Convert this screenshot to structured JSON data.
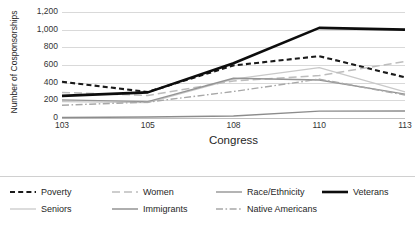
{
  "chart_data": {
    "type": "line",
    "title": "",
    "xlabel": "Congress",
    "ylabel": "Number of Cosponsorships",
    "categories": [
      "103",
      "105",
      "108",
      "110",
      "113"
    ],
    "x_tick_labels": [
      "103",
      "105",
      "108",
      "110",
      "113"
    ],
    "y_tick_labels": [
      "0",
      "200",
      "400",
      "600",
      "800",
      "1,000",
      "1,200"
    ],
    "y_tick_values": [
      0,
      200,
      400,
      600,
      800,
      1000,
      1200
    ],
    "ylim": [
      0,
      1200
    ],
    "grid": "horizontal",
    "legend_position": "bottom",
    "series": [
      {
        "name": "Poverty",
        "values": [
          410,
          295,
          595,
          700,
          460
        ],
        "color": "#1a1a1a",
        "style": "dashed",
        "width": 2.1,
        "dash": "5,3.2"
      },
      {
        "name": "Seniors",
        "values": [
          185,
          175,
          440,
          570,
          295
        ],
        "color": "#c9c9c9",
        "style": "solid",
        "width": 1.3,
        "dash": "none"
      },
      {
        "name": "Women",
        "values": [
          290,
          255,
          420,
          480,
          640
        ],
        "color": "#bdbdbd",
        "style": "long-dash",
        "width": 1.5,
        "dash": "8,4"
      },
      {
        "name": "Immigrants",
        "values": [
          5,
          12,
          22,
          78,
          80
        ],
        "color": "#8c8c8c",
        "style": "solid",
        "width": 1.4,
        "dash": "none"
      },
      {
        "name": "Race/Ethnicity",
        "values": [
          205,
          185,
          450,
          430,
          270
        ],
        "color": "#949494",
        "style": "solid",
        "width": 1.4,
        "dash": "none"
      },
      {
        "name": "Native Americans",
        "values": [
          145,
          180,
          300,
          440,
          260
        ],
        "color": "#a8a8a8",
        "style": "dash-dot",
        "width": 1.4,
        "dash": "7,2.5,1.6,2.5"
      },
      {
        "name": "Veterans",
        "values": [
          250,
          290,
          620,
          1020,
          1000
        ],
        "color": "#0d0d0d",
        "style": "solid",
        "width": 2.6,
        "dash": "none"
      }
    ],
    "legend_rows": [
      [
        {
          "name": "Poverty",
          "swatch": "legend-swatch-poverty"
        },
        {
          "name": "Women",
          "swatch": "legend-swatch-women"
        },
        {
          "name": "Race/Ethnicity",
          "swatch": "legend-swatch-race-ethnicity"
        },
        {
          "name": "Veterans",
          "swatch": "legend-swatch-veterans"
        }
      ],
      [
        {
          "name": "Seniors",
          "swatch": "legend-swatch-seniors"
        },
        {
          "name": "Immigrants",
          "swatch": "legend-swatch-immigrants"
        },
        {
          "name": "Native Americans",
          "swatch": "legend-swatch-native-americans"
        }
      ]
    ]
  }
}
